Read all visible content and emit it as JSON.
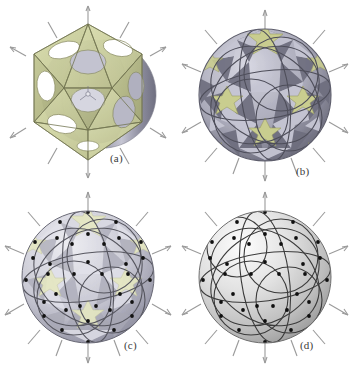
{
  "figure": {
    "background_color": "#ffffff",
    "width": 353,
    "height": 374
  },
  "panels": [
    {
      "id": "a",
      "label": "(a)",
      "title": "Icosahedral frame with circular apertures",
      "stage": "initial",
      "shape": "icosahedron",
      "face_color": "#ccd09e",
      "face_edge_color": "#8a8c63",
      "inner_shell_color": "#a9a9b8",
      "spike_color": "#9a9a9a",
      "face_count": 20,
      "aperture_count": 20,
      "spike_count": 12,
      "has_nodes": false
    },
    {
      "id": "b",
      "label": "(b)",
      "title": "Partially deployed sphere, dark facets",
      "stage": "partially-deployed",
      "shape": "geodesic-sphere",
      "face_color_dark": "#70707f",
      "face_color_light": "#c3c3d0",
      "star_color": "#c9cd8f",
      "great_circle_color": "#50505c",
      "spike_color": "#9a9a9a",
      "star_count": 12,
      "great_circle_count": 6,
      "spike_count": 12,
      "has_nodes": false
    },
    {
      "id": "c",
      "label": "(c)",
      "title": "Nearly closed sphere, translucent panels with nodes",
      "stage": "nearly-closed",
      "shape": "geodesic-sphere",
      "face_color_dark": "#a7a7b2",
      "face_color_light": "#dcdce4",
      "star_color": "#e2e4bd",
      "great_circle_color": "#5a5a62",
      "node_color": "#1a1a1a",
      "spike_color": "#9a9a9a",
      "star_count": 12,
      "great_circle_count": 6,
      "node_count": 42,
      "spike_count": 12,
      "has_nodes": true
    },
    {
      "id": "d",
      "label": "(d)",
      "title": "Fully closed smooth sphere",
      "stage": "closed",
      "shape": "sphere",
      "surface_color_highlight": "#fdfdfd",
      "surface_color_shade": "#9c9c9c",
      "great_circle_color": "#3a3a3a",
      "node_color": "#141414",
      "spike_color": "#9a9a9a",
      "great_circle_count": 6,
      "node_count": 42,
      "spike_count": 12,
      "has_nodes": true
    }
  ],
  "labels": {
    "a": "(a)",
    "b": "(b)",
    "c": "(c)",
    "d": "(d)"
  }
}
